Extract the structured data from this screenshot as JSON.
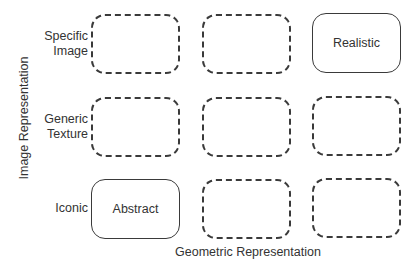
{
  "diagram": {
    "y_axis_label": "Image Representation",
    "x_axis_label": "Geometric Representation",
    "rows": [
      {
        "label": "Specific\nImage",
        "cells": [
          {
            "text": "",
            "style": "dashed"
          },
          {
            "text": "",
            "style": "dashed"
          },
          {
            "text": "Realistic",
            "style": "solid"
          }
        ]
      },
      {
        "label": "Generic\nTexture",
        "cells": [
          {
            "text": "",
            "style": "dashed"
          },
          {
            "text": "",
            "style": "dashed"
          },
          {
            "text": "",
            "style": "dashed"
          }
        ]
      },
      {
        "label": "Iconic",
        "cells": [
          {
            "text": "Abstract",
            "style": "solid"
          },
          {
            "text": "",
            "style": "dashed"
          },
          {
            "text": "",
            "style": "dashed"
          }
        ]
      }
    ],
    "colors": {
      "stroke": "#3a3a3a",
      "text": "#333333",
      "background": "#ffffff"
    }
  }
}
